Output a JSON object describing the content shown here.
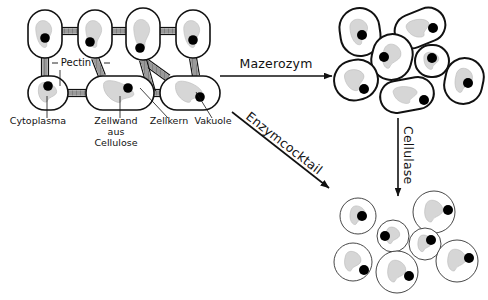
{
  "diagram": {
    "background_color": "#ffffff",
    "ink_color": "#111111",
    "wall_gray": "#8c8c8c",
    "cytoplasm_gray": "#d6d6d6",
    "nucleus_color": "#000000"
  },
  "tissue": {
    "name": "Pflanzengewebe",
    "labels": [
      {
        "id": "pectin",
        "text": "Pectin",
        "x": 76,
        "y": 66
      },
      {
        "id": "cytoplasma",
        "text": "Cytoplasma",
        "x": 38,
        "y": 124
      },
      {
        "id": "zellwand",
        "text": "Zellwand",
        "x": 116,
        "y": 124
      },
      {
        "id": "zellwand2",
        "text": "aus",
        "x": 116,
        "y": 135
      },
      {
        "id": "zellwand3",
        "text": "Cellulose",
        "x": 116,
        "y": 146
      },
      {
        "id": "zellkern",
        "text": "Zellkern",
        "x": 169,
        "y": 124
      },
      {
        "id": "vakuole",
        "text": "Vakuole",
        "x": 213,
        "y": 124
      }
    ],
    "cells_top": [
      {
        "id": "t1",
        "x": 28,
        "y": 10,
        "w": 34,
        "h": 48,
        "r": 17,
        "nucleus_x": 45,
        "nucleus_y": 38
      },
      {
        "id": "t2",
        "x": 78,
        "y": 10,
        "w": 34,
        "h": 48,
        "r": 17,
        "nucleus_x": 90,
        "nucleus_y": 42
      },
      {
        "id": "t3",
        "x": 126,
        "y": 8,
        "w": 34,
        "h": 52,
        "r": 17,
        "nucleus_x": 140,
        "nucleus_y": 48
      },
      {
        "id": "t4",
        "x": 176,
        "y": 10,
        "w": 34,
        "h": 48,
        "r": 17,
        "nucleus_x": 193,
        "nucleus_y": 40
      }
    ],
    "cells_bottom": [
      {
        "id": "b1",
        "x": 28,
        "y": 76,
        "w": 40,
        "h": 34,
        "r": 17,
        "nucleus_x": 48,
        "nucleus_y": 86
      },
      {
        "id": "b2",
        "x": 86,
        "y": 76,
        "w": 68,
        "h": 34,
        "r": 17,
        "nucleus_x": 128,
        "nucleus_y": 88
      },
      {
        "id": "b3",
        "x": 160,
        "y": 76,
        "w": 60,
        "h": 34,
        "r": 17,
        "nucleus_x": 200,
        "nucleus_y": 97
      }
    ]
  },
  "arrows": [
    {
      "id": "mazerozym",
      "label": "Mazerozym",
      "type": "horizontal",
      "x1": 220,
      "y1": 76,
      "x2": 332,
      "y2": 76,
      "label_x": 276,
      "label_y": 68,
      "rotation": 0
    },
    {
      "id": "enzymcocktail",
      "label": "Enzymcocktail",
      "type": "diagonal",
      "x1": 232,
      "y1": 112,
      "x2": 329,
      "y2": 188,
      "label_x": 245,
      "label_y": 118,
      "rotation": 38
    },
    {
      "id": "cellulase",
      "label": "Cellulase",
      "type": "vertical",
      "x1": 398,
      "y1": 118,
      "x2": 398,
      "y2": 196,
      "label_x": 404,
      "label_y": 126,
      "rotation": 90
    }
  ],
  "separated_cells": {
    "name": "Einzelzellen mit Zellwand",
    "count": 7,
    "cells": [
      {
        "id": "s1",
        "cx": 360,
        "cy": 32,
        "rx": 20,
        "ry": 24,
        "rot": -8,
        "nucleus_x": 362,
        "nucleus_y": 35
      },
      {
        "id": "s2",
        "cx": 420,
        "cy": 28,
        "rx": 26,
        "ry": 17,
        "rot": -22,
        "nucleus_x": 433,
        "nucleus_y": 28
      },
      {
        "id": "s3",
        "cx": 392,
        "cy": 57,
        "rx": 20,
        "ry": 23,
        "rot": 14,
        "nucleus_x": 384,
        "nucleus_y": 57
      },
      {
        "id": "s4",
        "cx": 432,
        "cy": 61,
        "rx": 17,
        "ry": 16,
        "rot": 0,
        "nucleus_x": 432,
        "nucleus_y": 58
      },
      {
        "id": "s5",
        "cx": 356,
        "cy": 80,
        "rx": 22,
        "ry": 20,
        "rot": -14,
        "nucleus_x": 364,
        "nucleus_y": 89
      },
      {
        "id": "s6",
        "cx": 464,
        "cy": 81,
        "rx": 19,
        "ry": 23,
        "rot": 12,
        "nucleus_x": 468,
        "nucleus_y": 83
      },
      {
        "id": "s7",
        "cx": 407,
        "cy": 95,
        "rx": 27,
        "ry": 16,
        "rot": -10,
        "nucleus_x": 424,
        "nucleus_y": 100
      }
    ]
  },
  "protoplasts": {
    "name": "Protoplasten ohne Zellwand",
    "count": 7,
    "cells": [
      {
        "id": "p1",
        "cx": 358,
        "cy": 216,
        "r": 18,
        "nucleus_x": 362,
        "nucleus_y": 216
      },
      {
        "id": "p2",
        "cx": 393,
        "cy": 236,
        "r": 16,
        "nucleus_x": 385,
        "nucleus_y": 236
      },
      {
        "id": "p3",
        "cx": 434,
        "cy": 212,
        "r": 21,
        "nucleus_x": 448,
        "nucleus_y": 210
      },
      {
        "id": "p4",
        "cx": 425,
        "cy": 244,
        "r": 16,
        "nucleus_x": 431,
        "nucleus_y": 240
      },
      {
        "id": "p5",
        "cx": 353,
        "cy": 262,
        "r": 19,
        "nucleus_x": 364,
        "nucleus_y": 270
      },
      {
        "id": "p6",
        "cx": 397,
        "cy": 272,
        "r": 21,
        "nucleus_x": 409,
        "nucleus_y": 276
      },
      {
        "id": "p7",
        "cx": 457,
        "cy": 261,
        "r": 21,
        "nucleus_x": 469,
        "nucleus_y": 258
      }
    ]
  }
}
